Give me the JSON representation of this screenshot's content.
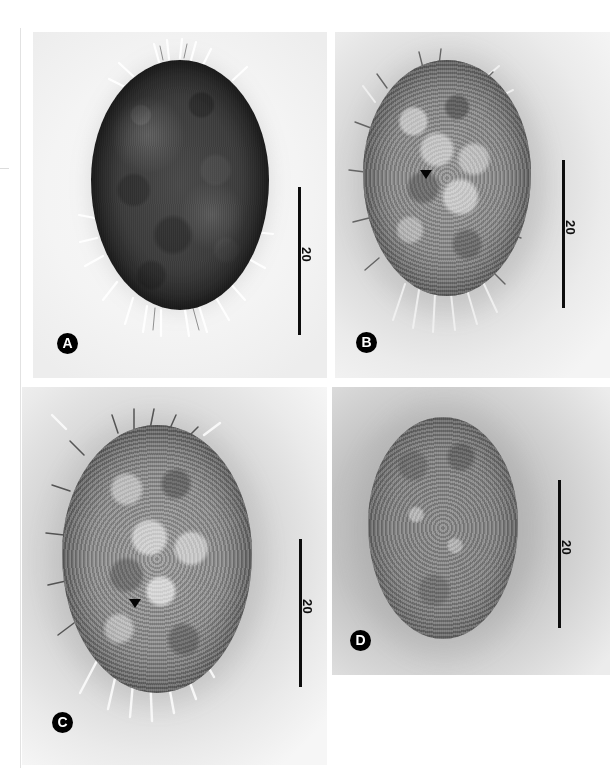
{
  "figure": {
    "kind": "micrograph-plate",
    "panel_count": 4,
    "background_color": "#ffffff"
  },
  "panels": [
    {
      "id": "A",
      "letter": "A",
      "scalebar": {
        "label": "20",
        "units_implied": "micrometers",
        "orientation": "vertical"
      },
      "specimen": {
        "description": "dark ovoid ciliate cell, dense opaque cortex, marginal cilia tufts",
        "tone": "dark",
        "has_arrowhead": false
      }
    },
    {
      "id": "B",
      "letter": "B",
      "scalebar": {
        "label": "20",
        "units_implied": "micrometers",
        "orientation": "vertical"
      },
      "specimen": {
        "description": "mid-focus ovoid cell showing granular endoplasm and macronucleus",
        "tone": "medium",
        "has_arrowhead": true
      }
    },
    {
      "id": "C",
      "letter": "C",
      "scalebar": {
        "label": "20",
        "units_implied": "micrometers",
        "orientation": "vertical"
      },
      "specimen": {
        "description": "ovoid cell with coarse cortical granules and ventral cirri",
        "tone": "medium",
        "has_arrowhead": true
      }
    },
    {
      "id": "D",
      "letter": "D",
      "scalebar": {
        "label": "20",
        "units_implied": "micrometers",
        "orientation": "vertical"
      },
      "specimen": {
        "description": "low-contrast surface view of cell showing cortical granule pattern",
        "tone": "light",
        "has_arrowhead": false
      }
    }
  ],
  "colors": {
    "ink": "#0d0d0d",
    "badge_fill": "#000000",
    "badge_text": "#ffffff",
    "plate_light": "#f5f5f5",
    "plate_mid": "#d8d8d8",
    "plate_dark": "#9a9a9a"
  }
}
